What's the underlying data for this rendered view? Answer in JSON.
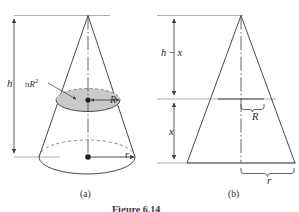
{
  "figure": {
    "caption": "Figure 6.14",
    "panels": [
      {
        "id": "a",
        "caption": "(a)",
        "description": "right circular cone with inscribed horizontal cross-sectional disk"
      },
      {
        "id": "b",
        "caption": "(b)",
        "description": "vertical cross-section of the cone as a triangle"
      }
    ]
  },
  "panel_a": {
    "height_label": "h",
    "area_label_pi": "π",
    "area_label_R": "R",
    "area_label_exp": "2",
    "disk_radius_label": "R",
    "base_radius_label": "r",
    "caption": "(a)",
    "disk_fill_color": "#c9c9c9",
    "stroke_color": "#3f3f3f"
  },
  "panel_b": {
    "upper_segment_label_h": "h",
    "upper_segment_label_minus": "−",
    "upper_segment_label_x": "x",
    "lower_segment_label": "x",
    "disk_radius_label": "R",
    "base_radius_label": "r",
    "caption": "(b)",
    "stroke_color": "#3f3f3f"
  },
  "colors": {
    "ink": "#3f3f3f",
    "thin_ink": "#6e6e6e",
    "shade": "#c9c9c9",
    "background": "#ffffff"
  }
}
